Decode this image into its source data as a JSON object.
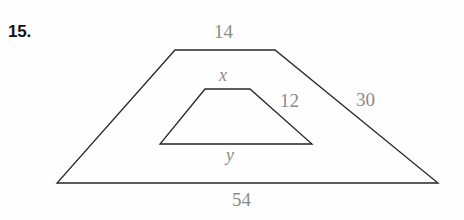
{
  "problem": {
    "number_label": "15."
  },
  "figure": {
    "stroke_color": "#262626",
    "label_color": "#8b8b8b",
    "background_color": "#fefefe",
    "outer_trapezoid": {
      "name": "outer-trapezoid",
      "points": "175,50 275,50 438,183 57,183",
      "labels": {
        "top": "14",
        "right_leg": "30",
        "bottom": "54"
      }
    },
    "inner_trapezoid": {
      "name": "inner-trapezoid",
      "points": "205,89 250,89 312,144 160,144",
      "labels": {
        "top": "x",
        "right_leg": "12",
        "bottom": "y"
      }
    }
  },
  "chart_data": {
    "type": "diagram",
    "title": "",
    "shapes": [
      {
        "name": "outer-trapezoid",
        "type": "trapezoid",
        "vertices": [
          [
            175,
            50
          ],
          [
            275,
            50
          ],
          [
            438,
            183
          ],
          [
            57,
            183
          ]
        ],
        "side_labels": {
          "top": "14",
          "right": "30",
          "bottom": "54",
          "left": ""
        }
      },
      {
        "name": "inner-trapezoid",
        "type": "trapezoid",
        "vertices": [
          [
            205,
            89
          ],
          [
            250,
            89
          ],
          [
            312,
            144
          ],
          [
            160,
            144
          ]
        ],
        "side_labels": {
          "top": "x",
          "right": "12",
          "bottom": "y",
          "left": ""
        }
      }
    ],
    "annotations": [
      "15.",
      "14",
      "30",
      "54",
      "x",
      "12",
      "y"
    ]
  }
}
